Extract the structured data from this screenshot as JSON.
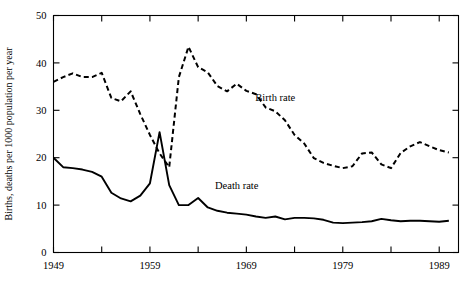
{
  "chart_data": {
    "type": "line",
    "title": "",
    "xlabel": "",
    "ylabel": "Births, deaths per 1000 population per year",
    "xlim": [
      1949,
      1991
    ],
    "ylim": [
      0,
      50
    ],
    "yticks": [
      0,
      10,
      20,
      30,
      40,
      50
    ],
    "ytick_labels": [
      "0",
      "10",
      "20",
      "30",
      "40",
      "50"
    ],
    "xticks": [
      1949,
      1954,
      1959,
      1964,
      1969,
      1974,
      1979,
      1984,
      1989
    ],
    "xtick_labels": [
      "1949",
      "",
      "1959",
      "",
      "1969",
      "",
      "1979",
      "",
      "1989"
    ],
    "xtick_labels_shown": [
      "1949",
      "1959",
      "1969",
      "1979",
      "1989"
    ],
    "grid": false,
    "legend_position": "inline-annotations",
    "x": [
      1949,
      1950,
      1951,
      1952,
      1953,
      1954,
      1955,
      1956,
      1957,
      1958,
      1959,
      1960,
      1961,
      1962,
      1963,
      1964,
      1965,
      1966,
      1967,
      1968,
      1969,
      1970,
      1971,
      1972,
      1973,
      1974,
      1975,
      1976,
      1977,
      1978,
      1979,
      1980,
      1981,
      1982,
      1983,
      1984,
      1985,
      1986,
      1987,
      1988,
      1989,
      1990
    ],
    "series": [
      {
        "name": "Birth rate",
        "style": "dashed",
        "color": "#000000",
        "label_text": "Birth rate",
        "values": [
          36.0,
          37.0,
          37.8,
          37.0,
          37.0,
          37.9,
          32.6,
          31.9,
          34.0,
          29.2,
          24.8,
          20.9,
          18.0,
          37.0,
          43.4,
          39.1,
          38.0,
          35.1,
          34.0,
          35.6,
          34.1,
          33.4,
          30.6,
          29.8,
          27.9,
          24.8,
          23.0,
          19.9,
          18.9,
          18.3,
          17.8,
          18.2,
          20.9,
          21.1,
          18.6,
          17.8,
          21.0,
          22.4,
          23.3,
          22.4,
          21.6,
          21.1
        ]
      },
      {
        "name": "Death rate",
        "style": "solid",
        "color": "#000000",
        "label_text": "Death rate",
        "values": [
          20.0,
          18.0,
          17.8,
          17.5,
          17.0,
          16.0,
          12.6,
          11.4,
          10.8,
          12.0,
          14.6,
          25.4,
          14.2,
          10.0,
          10.0,
          11.5,
          9.5,
          8.8,
          8.4,
          8.2,
          8.0,
          7.6,
          7.3,
          7.6,
          7.0,
          7.3,
          7.3,
          7.2,
          6.9,
          6.3,
          6.2,
          6.3,
          6.4,
          6.6,
          7.1,
          6.8,
          6.6,
          6.7,
          6.7,
          6.6,
          6.5,
          6.7
        ]
      }
    ],
    "annotations": [
      {
        "text": "Birth rate",
        "x": 1972,
        "y": 32.0
      },
      {
        "text": "Death rate",
        "x": 1968,
        "y": 13.5
      }
    ]
  },
  "axis": {
    "y_label": "Births, deaths per 1000 population per year"
  }
}
